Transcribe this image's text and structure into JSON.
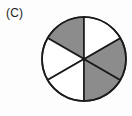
{
  "figure": {
    "part_label": "(C)",
    "caption": "",
    "colors": {
      "shaded": "#8c8c8c",
      "unshaded": "#ffffff",
      "outline": "#1b1b1b",
      "background": "#fdfdfd",
      "label_text": "#1b1b1b"
    }
  },
  "chart_data": {
    "type": "pie",
    "title": "(C)",
    "xlabel": "",
    "ylabel": "",
    "grid": false,
    "legend_position": "none",
    "total_slices": 6,
    "shaded_count": 3,
    "unshaded_count": 3,
    "shaded_fraction": "3/6",
    "slice_angle_degrees": 60,
    "center_x": 84,
    "center_y": 59,
    "radius": 42,
    "start_angle_degrees": 90,
    "categories": [
      "slice-1",
      "slice-2",
      "slice-3",
      "slice-4",
      "slice-5",
      "slice-6"
    ],
    "values": [
      60,
      60,
      60,
      60,
      60,
      60
    ],
    "slices": [
      {
        "name": "slice-1",
        "start_angle": 90,
        "end_angle": 150,
        "shaded": true,
        "fill": "#8c8c8c",
        "position": "upper-left"
      },
      {
        "name": "slice-2",
        "start_angle": 150,
        "end_angle": 210,
        "shaded": false,
        "fill": "#ffffff",
        "position": "left"
      },
      {
        "name": "slice-3",
        "start_angle": 210,
        "end_angle": 270,
        "shaded": false,
        "fill": "#ffffff",
        "position": "lower-left"
      },
      {
        "name": "slice-4",
        "start_angle": 270,
        "end_angle": 330,
        "shaded": true,
        "fill": "#8c8c8c",
        "position": "lower-right"
      },
      {
        "name": "slice-5",
        "start_angle": 330,
        "end_angle": 30,
        "shaded": true,
        "fill": "#8c8c8c",
        "position": "right"
      },
      {
        "name": "slice-6",
        "start_angle": 30,
        "end_angle": 90,
        "shaded": false,
        "fill": "#ffffff",
        "position": "upper-right"
      }
    ]
  }
}
